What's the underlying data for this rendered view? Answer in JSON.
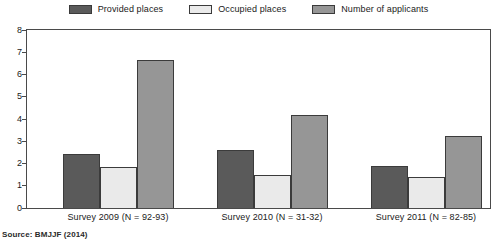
{
  "legend": {
    "position": "top-center",
    "items": [
      {
        "label": "Provided places",
        "color": "#5a5a5a",
        "icon": "legend-swatch-icon"
      },
      {
        "label": "Occupied places",
        "color": "#eaeaea",
        "icon": "legend-swatch-icon"
      },
      {
        "label": "Number of applicants",
        "color": "#969696",
        "icon": "legend-swatch-icon"
      }
    ]
  },
  "source": {
    "text": "Source: BMJJF (2014)"
  },
  "chart_data": {
    "type": "bar",
    "title": "",
    "subtitle": "",
    "xlabel": "",
    "ylabel": "",
    "ylim": [
      0,
      8
    ],
    "yticks": [
      0,
      1,
      2,
      3,
      4,
      5,
      6,
      7,
      8
    ],
    "ytick_labels": [
      "0",
      "1",
      "2",
      "3",
      "4",
      "5",
      "6",
      "7",
      "8"
    ],
    "grid": false,
    "legend_position": "top-center",
    "categories": [
      "Survey 2009 (N = 92-93)",
      "Survey 2010 (N = 31-32)",
      "Survey 2011 (N = 82-85)"
    ],
    "series": [
      {
        "name": "Provided places",
        "color": "#5a5a5a",
        "values": [
          2.45,
          2.6,
          1.9
        ]
      },
      {
        "name": "Occupied places",
        "color": "#eaeaea",
        "values": [
          1.85,
          1.5,
          1.4
        ]
      },
      {
        "name": "Number of applicants",
        "color": "#969696",
        "values": [
          6.65,
          4.2,
          3.25
        ]
      }
    ]
  }
}
